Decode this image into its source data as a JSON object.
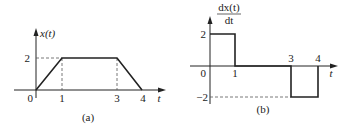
{
  "figure_a": {
    "caption": "(a)",
    "y_label": "x(t)",
    "x_label": "t",
    "y_ticks": [
      "2"
    ],
    "x_ticks": [
      "0",
      "1",
      "3",
      "4"
    ],
    "points": [
      [
        0,
        0
      ],
      [
        1,
        2
      ],
      [
        3,
        2
      ],
      [
        4,
        0
      ]
    ]
  },
  "figure_b": {
    "caption": "(b)",
    "y_label_num": "dx(t)",
    "y_label_den": "dt",
    "x_label": "t",
    "y_ticks": [
      "2",
      "−2"
    ],
    "x_ticks": [
      "0",
      "1",
      "3",
      "4"
    ],
    "segments": [
      {
        "t_start": 0,
        "t_end": 1,
        "value": 2
      },
      {
        "t_start": 1,
        "t_end": 3,
        "value": 0
      },
      {
        "t_start": 3,
        "t_end": 4,
        "value": -2
      }
    ]
  },
  "colors": {
    "line": "#222222",
    "dashed": "#444444"
  }
}
